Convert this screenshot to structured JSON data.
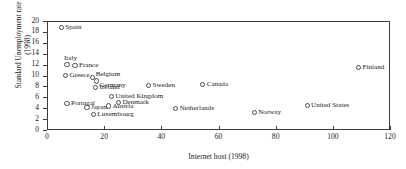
{
  "chart_data": {
    "type": "scatter",
    "title": "",
    "xlabel": "Internet host (1998)",
    "ylabel": "Standard Unemployment rate\n(1998)",
    "xlim": [
      0,
      120
    ],
    "ylim": [
      0,
      20
    ],
    "xticks": [
      0,
      20,
      40,
      60,
      80,
      100,
      120
    ],
    "yticks": [
      0,
      2,
      4,
      6,
      8,
      10,
      12,
      14,
      16,
      18,
      20
    ],
    "grid": false,
    "legend": null,
    "marker_style": "open-circle",
    "points": [
      {
        "label": "Spain",
        "x": 5.0,
        "y": 18.8,
        "label_pos": "right"
      },
      {
        "label": "Italy",
        "x": 7.0,
        "y": 12.0,
        "label_pos": "above"
      },
      {
        "label": "France",
        "x": 9.8,
        "y": 11.9,
        "label_pos": "right"
      },
      {
        "label": "Greece",
        "x": 6.5,
        "y": 10.0,
        "label_pos": "right"
      },
      {
        "label": "Belgium",
        "x": 16.0,
        "y": 9.6,
        "label_pos": "ar"
      },
      {
        "label": "Germany",
        "x": 17.2,
        "y": 9.0,
        "label_pos": "br"
      },
      {
        "label": "Ireland",
        "x": 17.0,
        "y": 7.8,
        "label_pos": "right"
      },
      {
        "label": "Sweden",
        "x": 35.5,
        "y": 8.2,
        "label_pos": "right"
      },
      {
        "label": "Canada",
        "x": 54.5,
        "y": 8.3,
        "label_pos": "right"
      },
      {
        "label": "Finland",
        "x": 109.0,
        "y": 11.4,
        "label_pos": "right"
      },
      {
        "label": "United Kingdom",
        "x": 22.5,
        "y": 6.2,
        "label_pos": "right"
      },
      {
        "label": "Portugal",
        "x": 7.0,
        "y": 4.9,
        "label_pos": "right"
      },
      {
        "label": "Denmark",
        "x": 25.0,
        "y": 5.1,
        "label_pos": "right"
      },
      {
        "label": "Austria",
        "x": 21.5,
        "y": 4.4,
        "label_pos": "right"
      },
      {
        "label": "Japan",
        "x": 14.0,
        "y": 4.1,
        "label_pos": "right"
      },
      {
        "label": "Netherlands",
        "x": 45.0,
        "y": 4.0,
        "label_pos": "right"
      },
      {
        "label": "Luxembourg",
        "x": 16.2,
        "y": 2.8,
        "label_pos": "right"
      },
      {
        "label": "Norway",
        "x": 72.5,
        "y": 3.2,
        "label_pos": "right"
      },
      {
        "label": "United States",
        "x": 91.0,
        "y": 4.5,
        "label_pos": "right"
      }
    ]
  }
}
